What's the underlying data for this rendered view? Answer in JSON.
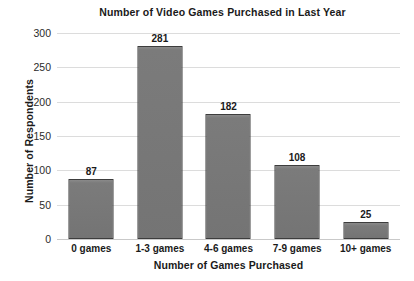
{
  "chart_data": {
    "type": "bar",
    "title": "Number of Video Games Purchased in Last Year",
    "xlabel": "Number of Games Purchased",
    "ylabel": "Number of Respondents",
    "categories": [
      "0 games",
      "1-3 games",
      "4-6 games",
      "7-9 games",
      "10+ games"
    ],
    "values": [
      87,
      281,
      182,
      108,
      25
    ],
    "ylim": [
      0,
      300
    ],
    "yticks": [
      0,
      50,
      100,
      150,
      200,
      250,
      300
    ],
    "ytick_labels": [
      "0",
      "50",
      "100",
      "150",
      "200",
      "250",
      "300"
    ],
    "grid": true,
    "legend": false,
    "bar_color": "#767676",
    "bar_edge_color": "#3d3d3d",
    "grid_color": "#dcdcdc",
    "background": "#ffffff",
    "data_labels": [
      "87",
      "281",
      "182",
      "108",
      "25"
    ]
  }
}
